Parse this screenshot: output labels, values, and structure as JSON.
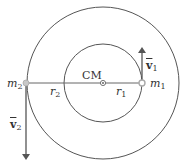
{
  "diagram": {
    "center_label": "CM",
    "mass1": {
      "label": "m",
      "sub": "1"
    },
    "mass2": {
      "label": "m",
      "sub": "2"
    },
    "radius1": {
      "label": "r",
      "sub": "1"
    },
    "radius2": {
      "label": "r",
      "sub": "2"
    },
    "velocity1": {
      "label": "v",
      "sub": "1"
    },
    "velocity2": {
      "label": "v",
      "sub": "2"
    },
    "colors": {
      "line": "#555555",
      "mass": "#bbbbbb",
      "background": "#ffffff"
    }
  }
}
